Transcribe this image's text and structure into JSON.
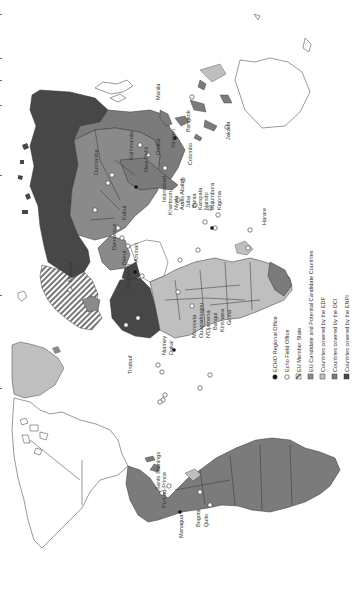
{
  "map": {
    "orientation": "rotated-90-ccw",
    "colors": {
      "eu_member_hatch_fg": "#666666",
      "eu_member_hatch_bg": "#ffffff",
      "candidate": "#8c8c8c",
      "edf": "#bfbfbf",
      "dci": "#7b7b7b",
      "enpi": "#474747",
      "uncovered": "#ffffff",
      "outline": "#555555"
    }
  },
  "legend": {
    "items": [
      {
        "symbol": "regional-office",
        "label": "ECHO Regional Office"
      },
      {
        "symbol": "field-office",
        "label": "Echo Field Office"
      },
      {
        "symbol": "hatch",
        "label": "EU Member State"
      },
      {
        "symbol": "candidate",
        "label": "EU Candidate and Potential Candidate Countries"
      },
      {
        "symbol": "edf",
        "label": "Countries covered by the EDF"
      },
      {
        "symbol": "dci",
        "label": "Countries covered by the DCI"
      },
      {
        "symbol": "enpi",
        "label": "Countries covered by the ENPI"
      }
    ]
  },
  "cities": {
    "americas": [
      "Port-au-Prince",
      "Santo Domingo",
      "Managua",
      "Bogota",
      "Quito"
    ],
    "africa_west": [
      "Tindouf",
      "Niamey",
      "Dakar",
      "Monrovia",
      "Ouagadougou",
      "N'Djamena",
      "Bangui",
      "Kinshasa",
      "Goma"
    ],
    "africa_east": [
      "Khartoum",
      "Nyala",
      "Addis Ababa",
      "Juba",
      "Bunia",
      "Kampala",
      "Nairobi",
      "Bujumbura",
      "Kigoma",
      "Harare"
    ],
    "middle_east": [
      "Jerusalem",
      "Amman",
      "Beirut",
      "Damascus"
    ],
    "europe_asia": [
      "Moscow",
      "Kabul",
      "Dushanbe",
      "Islamabad",
      "New Delhi",
      "Kathmandu",
      "Dhaka",
      "Yangon",
      "Colombo",
      "Bangkok",
      "Jakarta",
      "Manila"
    ]
  }
}
